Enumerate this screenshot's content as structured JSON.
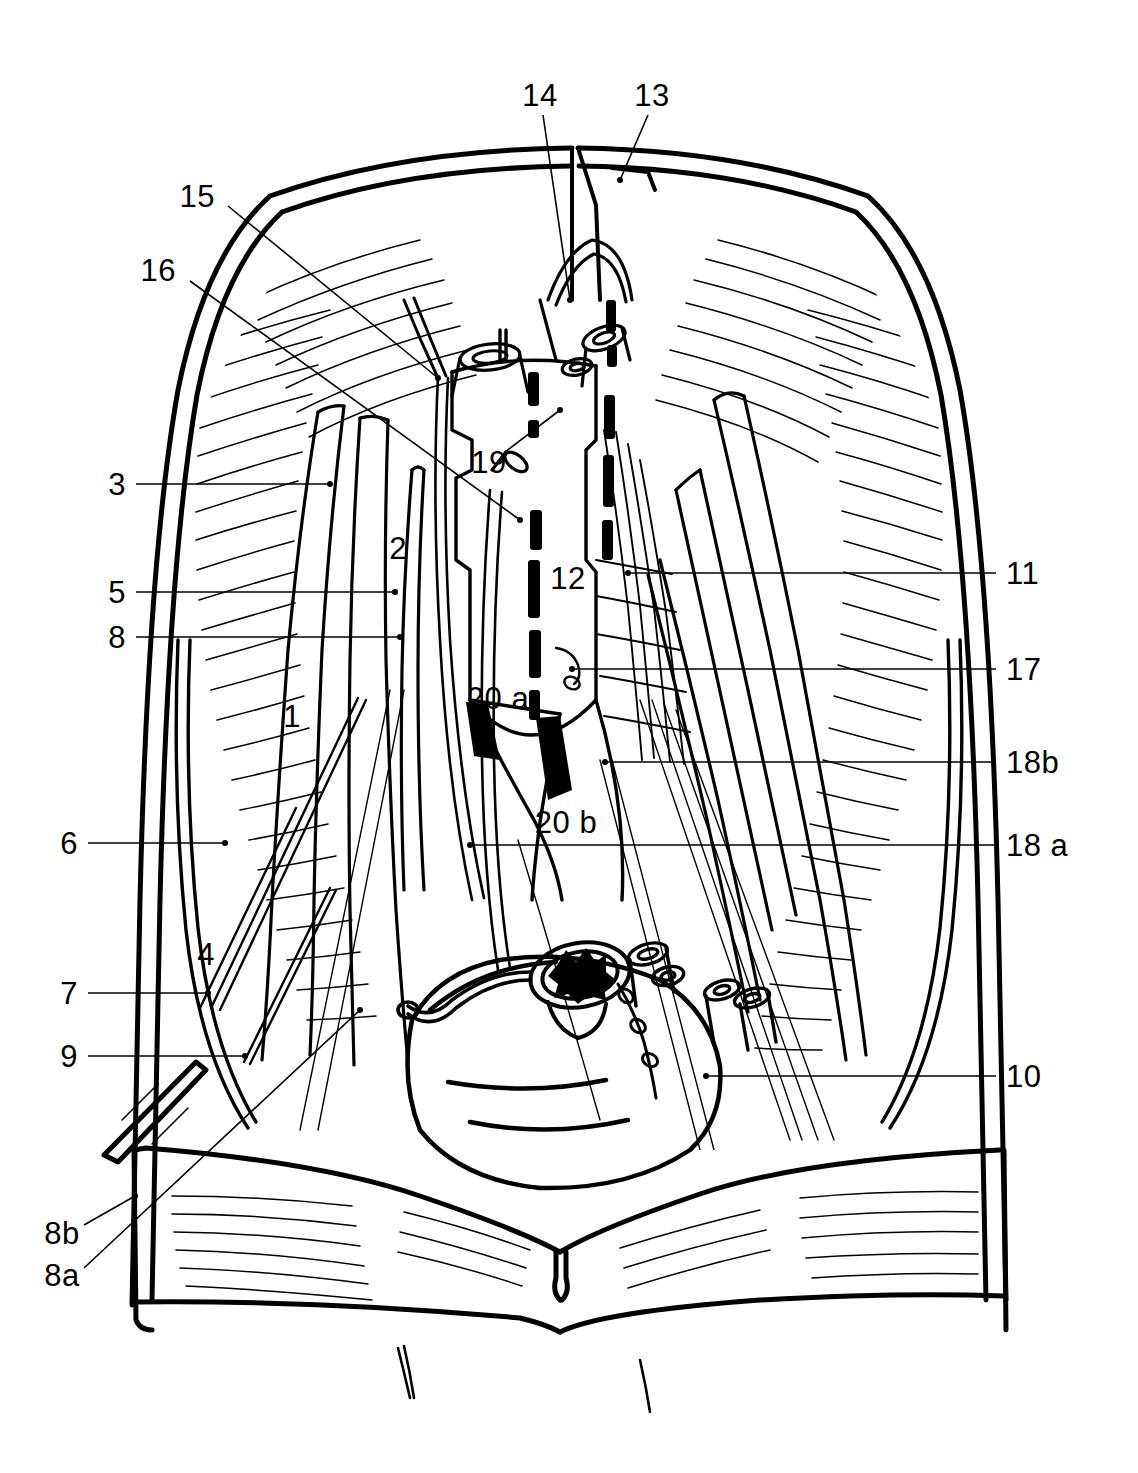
{
  "figure": {
    "type": "line-art-anatomical-illustration",
    "background_color": "#ffffff",
    "ink_color": "#000000",
    "width": 1138,
    "height": 1473
  },
  "labels": [
    {
      "id": "l14",
      "text": "14",
      "x": 540,
      "y": 95,
      "anchor": "mid",
      "leader": [
        [
          543,
          115
        ],
        [
          570,
          300
        ]
      ]
    },
    {
      "id": "l13",
      "text": "13",
      "x": 652,
      "y": 95,
      "anchor": "mid",
      "leader": [
        [
          648,
          115
        ],
        [
          620,
          180
        ]
      ]
    },
    {
      "id": "l15",
      "text": "15",
      "x": 215,
      "y": 196,
      "anchor": "right",
      "leader": [
        [
          228,
          206
        ],
        [
          438,
          378
        ]
      ]
    },
    {
      "id": "l16",
      "text": "16",
      "x": 176,
      "y": 270,
      "anchor": "right",
      "leader": [
        [
          190,
          281
        ],
        [
          520,
          520
        ]
      ]
    },
    {
      "id": "l3",
      "text": "3",
      "x": 126,
      "y": 484,
      "anchor": "right",
      "leader": [
        [
          136,
          484
        ],
        [
          330,
          484
        ]
      ]
    },
    {
      "id": "l2",
      "text": "2",
      "x": 398,
      "y": 548,
      "anchor": "mid",
      "leader": []
    },
    {
      "id": "l5",
      "text": "5",
      "x": 126,
      "y": 592,
      "anchor": "right",
      "leader": [
        [
          136,
          592
        ],
        [
          395,
          592
        ]
      ]
    },
    {
      "id": "l8",
      "text": "8",
      "x": 126,
      "y": 637,
      "anchor": "right",
      "leader": [
        [
          136,
          637
        ],
        [
          400,
          637
        ]
      ]
    },
    {
      "id": "l12",
      "text": "12",
      "x": 568,
      "y": 578,
      "anchor": "mid",
      "leader": []
    },
    {
      "id": "l11",
      "text": "11",
      "x": 1006,
      "y": 573,
      "anchor": "left",
      "leader": [
        [
          996,
          573
        ],
        [
          628,
          573
        ]
      ]
    },
    {
      "id": "l17",
      "text": "17",
      "x": 1006,
      "y": 669,
      "anchor": "left",
      "leader": [
        [
          996,
          669
        ],
        [
          572,
          669
        ]
      ]
    },
    {
      "id": "l1",
      "text": "1",
      "x": 292,
      "y": 716,
      "anchor": "mid",
      "leader": []
    },
    {
      "id": "l20a",
      "text": "20 a",
      "x": 498,
      "y": 698,
      "anchor": "mid",
      "leader": []
    },
    {
      "id": "l18b",
      "text": "18b",
      "x": 1006,
      "y": 762,
      "anchor": "left",
      "leader": [
        [
          996,
          762
        ],
        [
          605,
          762
        ]
      ]
    },
    {
      "id": "l20b",
      "text": "20 b",
      "x": 566,
      "y": 822,
      "anchor": "mid",
      "leader": []
    },
    {
      "id": "l6",
      "text": "6",
      "x": 78,
      "y": 843,
      "anchor": "right",
      "leader": [
        [
          88,
          843
        ],
        [
          225,
          843
        ]
      ]
    },
    {
      "id": "l18a",
      "text": "18 a",
      "x": 1006,
      "y": 845,
      "anchor": "left",
      "leader": [
        [
          996,
          845
        ],
        [
          470,
          845
        ]
      ]
    },
    {
      "id": "l4",
      "text": "4",
      "x": 206,
      "y": 954,
      "anchor": "mid",
      "leader": []
    },
    {
      "id": "l7",
      "text": "7",
      "x": 78,
      "y": 993,
      "anchor": "right",
      "leader": [
        [
          88,
          993
        ],
        [
          208,
          993
        ]
      ]
    },
    {
      "id": "l9",
      "text": "9",
      "x": 78,
      "y": 1056,
      "anchor": "right",
      "leader": [
        [
          88,
          1056
        ],
        [
          245,
          1056
        ]
      ]
    },
    {
      "id": "l10",
      "text": "10",
      "x": 1006,
      "y": 1076,
      "anchor": "left",
      "leader": [
        [
          996,
          1076
        ],
        [
          706,
          1076
        ]
      ]
    },
    {
      "id": "l19",
      "text": "19",
      "x": 489,
      "y": 462,
      "anchor": "mid",
      "leader": [
        [
          505,
          452
        ],
        [
          560,
          410
        ]
      ]
    },
    {
      "id": "l8b",
      "text": "8b",
      "x": 62,
      "y": 1233,
      "anchor": "mid",
      "leader": [
        [
          84,
          1225
        ],
        [
          135,
          1196
        ]
      ]
    },
    {
      "id": "l8a",
      "text": "8a",
      "x": 62,
      "y": 1275,
      "anchor": "mid",
      "leader": [
        [
          84,
          1268
        ],
        [
          360,
          1010
        ]
      ]
    }
  ],
  "leader_line_color": "#000000",
  "leader_line_width": 1.6
}
